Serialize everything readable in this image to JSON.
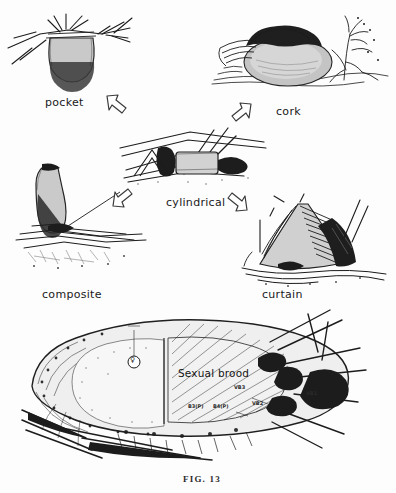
{
  "figure": {
    "caption": "FIG. 13",
    "panels": [
      {
        "id": "pocket",
        "label": "pocket",
        "description": "pocket-type nest hanging from twig"
      },
      {
        "id": "cork",
        "label": "cork",
        "description": "cork-type nest on ground with vegetation"
      },
      {
        "id": "cylindrical",
        "label": "cylindrical",
        "description": "cylindrical-type nest among twigs"
      },
      {
        "id": "composite",
        "label": "composite",
        "description": "composite-type nest with elongated chamber"
      },
      {
        "id": "curtain",
        "label": "curtain",
        "description": "curtain-type nest with draped fibres"
      }
    ],
    "arrows": [
      {
        "id": "arrow-to-pocket",
        "direction": "up-left",
        "from": "cylindrical",
        "to": "pocket"
      },
      {
        "id": "arrow-to-cork",
        "direction": "up-right",
        "from": "cylindrical",
        "to": "cork"
      },
      {
        "id": "arrow-to-composite",
        "direction": "down-left",
        "from": "cylindrical",
        "to": "composite"
      },
      {
        "id": "arrow-to-curtain",
        "direction": "down-right",
        "from": "cylindrical",
        "to": "curtain"
      }
    ],
    "bottom_panel": {
      "id": "nest-section",
      "brood_label": "Sexual brood",
      "queen_marker": "♀",
      "annotations": [
        {
          "id": "vb3",
          "text": "VB3"
        },
        {
          "id": "vb2",
          "text": "VB2"
        },
        {
          "id": "vb1",
          "text": "VB1"
        },
        {
          "id": "b3p",
          "text": "B3(P)"
        },
        {
          "id": "b4p",
          "text": "B4(P)"
        }
      ]
    },
    "colors": {
      "ink": "#1c1c1c",
      "paper": "#fdfdfd",
      "soft_ink": "#6d6d6d"
    }
  }
}
